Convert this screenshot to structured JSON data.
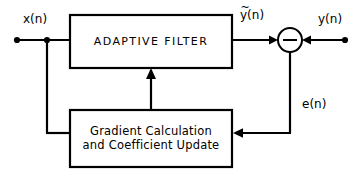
{
  "diagram": {
    "stroke_color": "#000000",
    "background_color": "#ffffff",
    "blocks": [
      {
        "id": "adaptive-filter",
        "label": "ADAPTIVE FILTER",
        "x": 70,
        "y": 15,
        "width": 162,
        "height": 53
      },
      {
        "id": "gradient-update",
        "label_line1": "Gradient Calculation",
        "label_line2": "and Coefficient Update",
        "x": 70,
        "y": 110,
        "width": 162,
        "height": 57
      }
    ],
    "summing_junction": {
      "id": "summing-junction",
      "sign": "−",
      "cx": 290,
      "cy": 40,
      "r": 12
    },
    "signals": {
      "input": "x(n)",
      "filter_output": "y(n)",
      "filter_output_accent": "~",
      "desired": "y(n)",
      "error": "e(n)"
    },
    "terminals": [
      {
        "id": "input-terminal",
        "x": 17,
        "y": 40
      },
      {
        "id": "tap-junction",
        "x": 47,
        "y": 40
      },
      {
        "id": "desired-terminal",
        "x": 345,
        "y": 40
      }
    ]
  }
}
